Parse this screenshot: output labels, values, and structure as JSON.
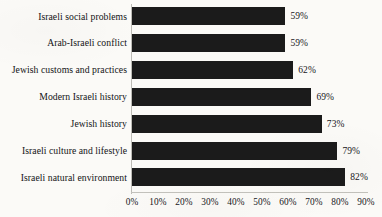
{
  "chart_data": {
    "type": "bar",
    "orientation": "horizontal",
    "title": "",
    "subtitle": "",
    "xlabel": "",
    "ylabel": "",
    "categories": [
      "Israeli social problems",
      "Arab-Israeli conflict",
      "Jewish customs and practices",
      "Modern Israeli history",
      "Jewish history",
      "Israeli culture and lifestyle",
      "Israeli natural environment"
    ],
    "values": [
      59,
      59,
      62,
      69,
      73,
      79,
      82
    ],
    "value_labels": [
      "59%",
      "59%",
      "62%",
      "69%",
      "73%",
      "79%",
      "82%"
    ],
    "xlim": [
      0,
      90
    ],
    "xtick_values": [
      0,
      10,
      20,
      30,
      40,
      50,
      60,
      70,
      80,
      90
    ],
    "xtick_labels": [
      "0%",
      "10%",
      "20%",
      "30%",
      "40%",
      "50%",
      "60%",
      "70%",
      "80%",
      "90%"
    ],
    "grid": false,
    "legend": null,
    "legend_position": "none",
    "bar_color": "#1b1b1b",
    "background_color": "#fbfaf7",
    "axis_color": "#c3c2bc",
    "text_color": "#16161a"
  }
}
